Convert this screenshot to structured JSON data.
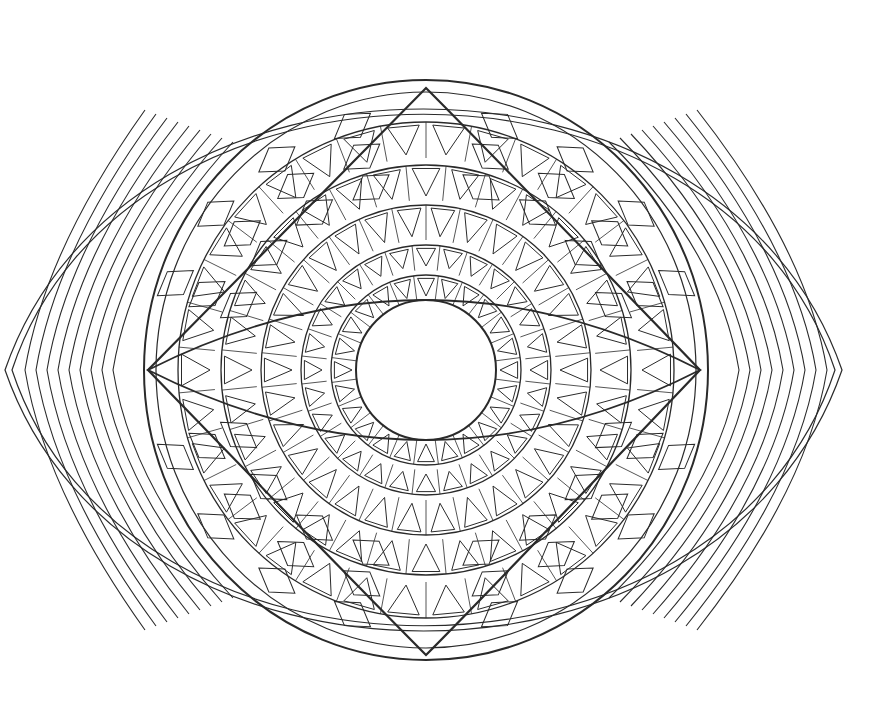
{
  "artwork": {
    "title": "Eye-shaped geometric mandala coloring page",
    "kind": "line-art",
    "stroke_color": "#2a2a2a",
    "background_color": "#ffffff",
    "center": [
      426,
      370
    ],
    "outer_eye": {
      "left_tip": [
        5,
        370
      ],
      "right_tip": [
        842,
        370
      ],
      "top_y": 62,
      "bottom_y": 678
    },
    "outer_band_lines": 2,
    "side_chevron_lines": 9,
    "inner_circle": {
      "cx": 426,
      "cy": 370,
      "r": 70
    },
    "inner_circle_rays": 13,
    "triangle_rings": [
      {
        "r_in": 70,
        "r_out": 95,
        "count": 24
      },
      {
        "r_in": 100,
        "r_out": 125,
        "count": 28
      },
      {
        "r_in": 130,
        "r_out": 165,
        "count": 30
      },
      {
        "r_in": 170,
        "r_out": 205,
        "count": 32
      },
      {
        "r_in": 212,
        "r_out": 248,
        "count": 34
      }
    ],
    "middle_circle": {
      "r": 280
    },
    "lens_shape": {
      "left": [
        148,
        370
      ],
      "right": [
        700,
        370
      ],
      "top": [
        426,
        88
      ],
      "bottom": [
        426,
        655
      ]
    },
    "diamond_grid_rows": 3
  }
}
